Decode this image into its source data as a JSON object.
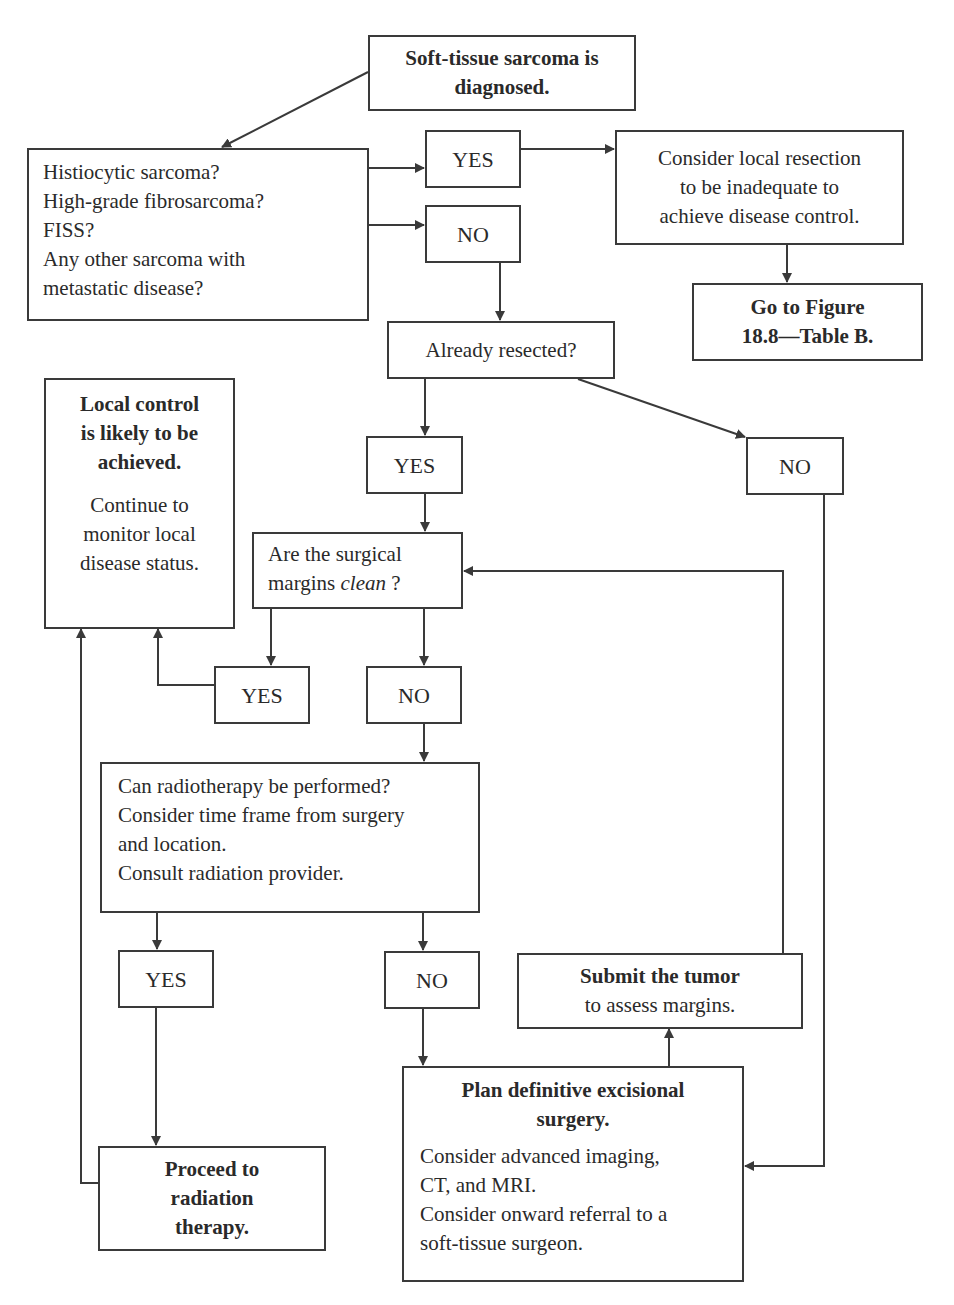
{
  "diagram": {
    "type": "flowchart",
    "nodes": {
      "start": {
        "lines": [
          "Soft-tissue sarcoma is",
          "diagnosed."
        ],
        "bold": true
      },
      "q_high_risk": {
        "lines": [
          "Histiocytic sarcoma?",
          "High-grade fibrosarcoma?",
          "FISS?",
          "Any other sarcoma with",
          "metastatic disease?"
        ]
      },
      "yes_1": {
        "label": "YES"
      },
      "no_1": {
        "label": "NO"
      },
      "consider_local": {
        "lines": [
          "Consider local resection",
          "to be inadequate to",
          "achieve disease control."
        ]
      },
      "goto_fig": {
        "lines": [
          "Go to Figure",
          "18.8—Table B."
        ],
        "bold": true
      },
      "q_resected": {
        "lines": [
          "Already resected?"
        ]
      },
      "yes_2": {
        "label": "YES"
      },
      "no_2": {
        "label": "NO"
      },
      "local_control": {
        "title_lines": [
          "Local control",
          "is likely to be",
          "achieved."
        ],
        "body_lines": [
          "Continue to",
          "monitor local",
          "disease status."
        ]
      },
      "q_margins": {
        "line1": "Are the surgical",
        "line2_prefix": "margins ",
        "line2_italic": "clean",
        "line2_suffix": " ?"
      },
      "yes_3": {
        "label": "YES"
      },
      "no_3": {
        "label": "NO"
      },
      "q_radiotherapy": {
        "lines": [
          "Can radiotherapy be performed?",
          "Consider time frame from surgery",
          "and location.",
          "Consult radiation provider."
        ]
      },
      "yes_4": {
        "label": "YES"
      },
      "no_4": {
        "label": "NO"
      },
      "submit_tumor": {
        "title": "Submit the tumor",
        "body": "to assess margins."
      },
      "plan_surgery": {
        "title_lines": [
          "Plan definitive excisional",
          "surgery."
        ],
        "body_lines": [
          "Consider advanced imaging,",
          "CT, and MRI.",
          "Consider onward referral to a",
          "soft-tissue surgeon."
        ]
      },
      "proceed_radiation": {
        "lines": [
          "Proceed to",
          "radiation",
          "therapy."
        ],
        "bold": true
      }
    },
    "edges": [
      [
        "start",
        "q_high_risk"
      ],
      [
        "q_high_risk",
        "yes_1"
      ],
      [
        "q_high_risk",
        "no_1"
      ],
      [
        "yes_1",
        "consider_local"
      ],
      [
        "consider_local",
        "goto_fig"
      ],
      [
        "no_1",
        "q_resected"
      ],
      [
        "q_resected",
        "yes_2"
      ],
      [
        "q_resected",
        "no_2"
      ],
      [
        "yes_2",
        "q_margins"
      ],
      [
        "q_margins",
        "yes_3"
      ],
      [
        "q_margins",
        "no_3"
      ],
      [
        "yes_3",
        "local_control"
      ],
      [
        "no_3",
        "q_radiotherapy"
      ],
      [
        "q_radiotherapy",
        "yes_4"
      ],
      [
        "q_radiotherapy",
        "no_4"
      ],
      [
        "yes_4",
        "proceed_radiation"
      ],
      [
        "proceed_radiation",
        "local_control"
      ],
      [
        "no_4",
        "plan_surgery"
      ],
      [
        "no_2",
        "plan_surgery"
      ],
      [
        "plan_surgery",
        "submit_tumor"
      ],
      [
        "submit_tumor",
        "q_margins"
      ]
    ]
  },
  "colors": {
    "line": "#3a3a3a",
    "background": "#ffffff"
  }
}
